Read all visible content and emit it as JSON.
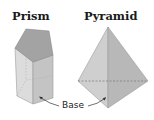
{
  "figure": {
    "shapes": [
      {
        "name": "prism",
        "title": "Prism"
      },
      {
        "name": "pyramid",
        "title": "Pyramid"
      }
    ],
    "annotation": {
      "label": "Base",
      "points_to": [
        "prism-base",
        "pyramid-base"
      ]
    }
  },
  "colors": {
    "face_light": "#d6d6d6",
    "face_mid": "#bdbdbd",
    "face_dark": "#a8a8a8",
    "top_face": "#9e9e9e",
    "edge": "#8a8a8a",
    "text": "#1a1a1a"
  }
}
